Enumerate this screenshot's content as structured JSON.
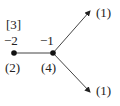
{
  "diagram": {
    "colors": {
      "line": "#444444",
      "node": "#111111",
      "text": "#222222"
    },
    "nodes": [
      {
        "id": "left",
        "weight_label": "−2",
        "multiplicity_label": "(2)",
        "bracket_label": "[3]"
      },
      {
        "id": "center",
        "weight_label": "−1",
        "multiplicity_label": "(4)"
      }
    ],
    "arrows": [
      {
        "id": "upper",
        "end_label": "(1)"
      },
      {
        "id": "lower",
        "end_label": "(1)"
      }
    ]
  }
}
